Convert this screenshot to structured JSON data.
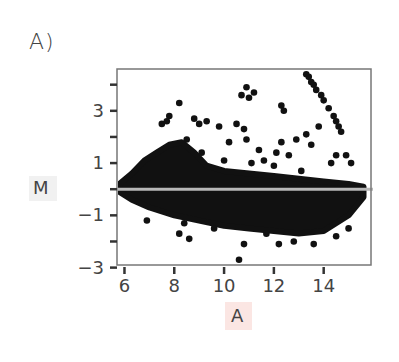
{
  "panel_label": "A)",
  "chart_data": {
    "type": "scatter",
    "title": "",
    "xlabel": "A",
    "ylabel": "M",
    "xlim": [
      5.7,
      15.9
    ],
    "ylim": [
      -2.9,
      4.6
    ],
    "xticks": [
      6,
      8,
      10,
      12,
      14
    ],
    "xtick_labels": [
      "6",
      "8",
      "10",
      "12",
      "14"
    ],
    "yticks": [
      -3,
      -2,
      -1,
      0,
      1,
      2,
      3,
      4
    ],
    "ytick_labels": [
      "−3",
      "",
      "−1",
      "",
      "1",
      "",
      "3",
      ""
    ],
    "grid": false,
    "legend": null,
    "reference_line": {
      "y": 0,
      "color": "#b8b8b8"
    },
    "point_color": "#111111",
    "dense_cloud": {
      "description": "Dense MA-plot cloud centered at M=0 spanning A≈5.8–15.6",
      "upper_envelope": [
        [
          5.8,
          0.2
        ],
        [
          6.3,
          0.6
        ],
        [
          6.8,
          1.1
        ],
        [
          7.3,
          1.4
        ],
        [
          7.8,
          1.7
        ],
        [
          8.3,
          1.8
        ],
        [
          8.8,
          1.4
        ],
        [
          9.3,
          0.9
        ],
        [
          10,
          0.7
        ],
        [
          11,
          0.6
        ],
        [
          12,
          0.5
        ],
        [
          13,
          0.4
        ],
        [
          14,
          0.3
        ],
        [
          15,
          0.2
        ],
        [
          15.6,
          0.1
        ]
      ],
      "lower_envelope": [
        [
          5.8,
          -0.1
        ],
        [
          6.3,
          -0.4
        ],
        [
          7,
          -0.7
        ],
        [
          8,
          -1.0
        ],
        [
          9,
          -1.2
        ],
        [
          10,
          -1.4
        ],
        [
          11,
          -1.5
        ],
        [
          12,
          -1.6
        ],
        [
          13,
          -1.7
        ],
        [
          14,
          -1.6
        ],
        [
          15,
          -1.0
        ],
        [
          15.6,
          -0.3
        ]
      ]
    },
    "outlier_points": [
      [
        10.9,
        3.9
      ],
      [
        11.2,
        3.7
      ],
      [
        10.7,
        3.6
      ],
      [
        11.0,
        3.5
      ],
      [
        8.2,
        3.3
      ],
      [
        12.3,
        3.2
      ],
      [
        12.4,
        3.0
      ],
      [
        13.3,
        4.4
      ],
      [
        13.4,
        4.3
      ],
      [
        13.5,
        4.1
      ],
      [
        13.6,
        4.0
      ],
      [
        13.7,
        3.8
      ],
      [
        13.9,
        3.6
      ],
      [
        14.0,
        3.4
      ],
      [
        14.2,
        3.1
      ],
      [
        14.4,
        2.8
      ],
      [
        14.5,
        2.6
      ],
      [
        14.6,
        2.4
      ],
      [
        14.7,
        2.2
      ],
      [
        7.8,
        2.8
      ],
      [
        8.8,
        2.7
      ],
      [
        9.3,
        2.6
      ],
      [
        7.5,
        2.5
      ],
      [
        7.7,
        2.6
      ],
      [
        9.0,
        2.5
      ],
      [
        9.8,
        2.4
      ],
      [
        10.5,
        2.5
      ],
      [
        10.8,
        2.3
      ],
      [
        13.3,
        2.1
      ],
      [
        13.8,
        2.4
      ],
      [
        12.9,
        1.9
      ],
      [
        13.5,
        1.7
      ],
      [
        14.5,
        1.3
      ],
      [
        14.9,
        1.3
      ],
      [
        15.1,
        1.0
      ],
      [
        14.3,
        1.0
      ],
      [
        8.5,
        1.9
      ],
      [
        10.2,
        1.8
      ],
      [
        10.9,
        1.9
      ],
      [
        11.4,
        1.5
      ],
      [
        12.3,
        1.8
      ],
      [
        11.6,
        1.1
      ],
      [
        12.6,
        1.3
      ],
      [
        12.1,
        1.4
      ],
      [
        9.1,
        1.4
      ],
      [
        10.0,
        1.1
      ],
      [
        11.1,
        1.0
      ],
      [
        13.1,
        0.7
      ],
      [
        12.0,
        0.9
      ],
      [
        6.9,
        -1.2
      ],
      [
        8.2,
        -1.7
      ],
      [
        8.4,
        -1.3
      ],
      [
        8.6,
        -1.9
      ],
      [
        9.6,
        -1.5
      ],
      [
        10.8,
        -2.1
      ],
      [
        10.6,
        -2.7
      ],
      [
        11.7,
        -1.7
      ],
      [
        12.2,
        -2.1
      ],
      [
        13.6,
        -2.1
      ],
      [
        14.5,
        -1.8
      ],
      [
        12.8,
        -2.0
      ],
      [
        15.0,
        -1.5
      ]
    ]
  }
}
